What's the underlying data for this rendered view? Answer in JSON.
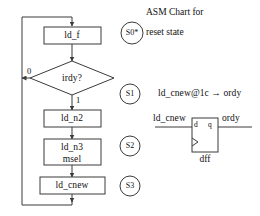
{
  "diagram": {
    "title_line1": "ASM Chart for",
    "title_line2": "reset state",
    "background_color": "#ffffff",
    "line_color": "#3a3a3a",
    "text_color": "#101010"
  },
  "flow": {
    "boxes": [
      {
        "id": "box-ld-f",
        "label": "ld_f"
      },
      {
        "id": "box-ld-n2",
        "label": "ld_n2"
      },
      {
        "id": "box-ld-n3",
        "label_line1": "ld_n3",
        "label_line2": "msel"
      },
      {
        "id": "box-ld-cnew",
        "label": "ld_cnew"
      }
    ],
    "decision": {
      "id": "decision-irdy",
      "label": "irdy?",
      "branch_false": "0",
      "branch_true": "1"
    }
  },
  "states": [
    {
      "id": "state-s0",
      "label": "S0*"
    },
    {
      "id": "state-s1",
      "label": "S1"
    },
    {
      "id": "state-s2",
      "label": "S2"
    },
    {
      "id": "state-s3",
      "label": "S3"
    }
  ],
  "expression": {
    "text": "ld_cnew@1c → ordy"
  },
  "flipflop": {
    "input_label": "ld_cnew",
    "output_label": "ordy",
    "pin_d": "d",
    "pin_q": "q",
    "name": "dff"
  }
}
